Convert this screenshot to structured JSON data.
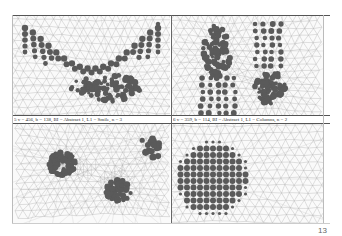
{
  "page": {
    "page_number": "13",
    "colors": {
      "mesh_line": "#a8a8a8",
      "dot": "#5a5a5a",
      "rule": "#555555",
      "panel_bg": "#fafafa"
    }
  },
  "panels": [
    {
      "id": "p1",
      "pattern": "smile",
      "caption": "",
      "description": "Triangular mesh with arc of dots forming a smile shape"
    },
    {
      "id": "p2",
      "pattern": "columns",
      "caption": "",
      "description": "Triangular mesh with two vertical columns of dots"
    },
    {
      "id": "p3",
      "pattern": "three-clusters",
      "caption": "",
      "description": "Triangular mesh with three dot clusters"
    },
    {
      "id": "p4",
      "pattern": "disc",
      "caption": "",
      "description": "Triangular mesh with a large circular disc of dots"
    }
  ],
  "captions": [
    "5 v = 456, b = 138, BI = Abstract 1, L1 = Smile, n = 3",
    "6 v = 359, b = 114, BI = Abstract 1, L1 = Columns, n = 2"
  ]
}
